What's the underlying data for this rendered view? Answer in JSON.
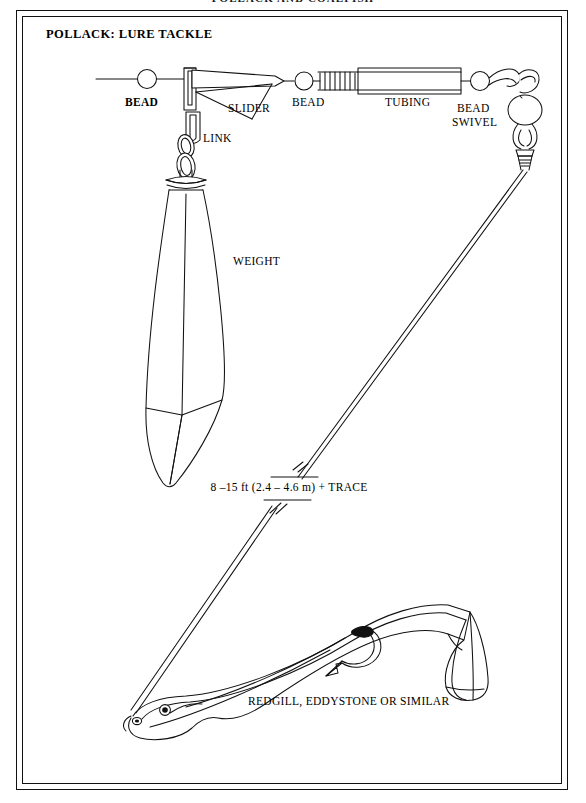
{
  "page": {
    "running_head": "POLLACK AND COALFISH",
    "plate_title": "POLLACK: LURE TACKLE",
    "background_color": "#ffffff",
    "ink_color": "#000000"
  },
  "labels": {
    "bead_left": "BEAD",
    "slider": "SLIDER",
    "bead_mid": "BEAD",
    "tubing": "TUBING",
    "bead_swivel_line1": "BEAD",
    "bead_swivel_line2": "SWIVEL",
    "link": "LINK",
    "weight": "WEIGHT",
    "trace": "8 –15 ft (2.4 – 4.6 m) + TRACE",
    "lure": "REDGILL, EDDYSTONE OR SIMILAR"
  },
  "diagram": {
    "type": "technical-line-illustration",
    "components": [
      {
        "name": "mainline",
        "shape": "horizontal-line"
      },
      {
        "name": "bead",
        "shape": "circle"
      },
      {
        "name": "slider",
        "shape": "wedge-boom"
      },
      {
        "name": "link",
        "shape": "interlocking-oval-rings"
      },
      {
        "name": "weight",
        "shape": "elongated-teardrop-sinker"
      },
      {
        "name": "bead-second",
        "shape": "circle"
      },
      {
        "name": "spring-coil",
        "shape": "helix"
      },
      {
        "name": "tubing",
        "shape": "long-rectangle-tube"
      },
      {
        "name": "swivel",
        "shape": "oval-barrel-with-loops"
      },
      {
        "name": "trace",
        "shape": "double-line-with-break-marks"
      },
      {
        "name": "lure",
        "shape": "sand-eel-body"
      },
      {
        "name": "hook",
        "shape": "barbed-curved-hook"
      },
      {
        "name": "tail-fin",
        "shape": "flared-paddle"
      },
      {
        "name": "eye",
        "shape": "ringed-dot"
      }
    ],
    "trace_length_ft": [
      8,
      15
    ],
    "trace_length_m": [
      2.4,
      4.6
    ]
  }
}
